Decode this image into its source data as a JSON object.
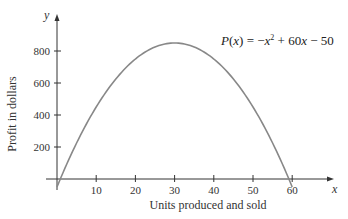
{
  "chart_data": {
    "type": "line",
    "title": "",
    "equation": "P(x) = −x² + 60x − 50",
    "xlabel": "Units produced and sold",
    "ylabel": "Profit in dollars",
    "x_axis_var": "x",
    "y_axis_var": "y",
    "xlim": [
      0,
      65
    ],
    "ylim": [
      -50,
      950
    ],
    "x_ticks": [
      10,
      20,
      30,
      40,
      50,
      60
    ],
    "y_ticks": [
      200,
      400,
      600,
      800
    ],
    "grid": false,
    "series": [
      {
        "name": "P(x)",
        "x": [
          0,
          1,
          5,
          10,
          15,
          20,
          25,
          30,
          35,
          40,
          45,
          50,
          55,
          59,
          60
        ],
        "values": [
          -50,
          9,
          225,
          450,
          625,
          750,
          825,
          850,
          825,
          750,
          625,
          450,
          225,
          9,
          -50
        ]
      }
    ],
    "curve_color": "#888888",
    "axis_color": "#333333"
  },
  "labels": {
    "xlabel": "Units produced and sold",
    "ylabel": "Profit in dollars",
    "x_var": "x",
    "y_var": "y",
    "eq_P": "P",
    "eq_x": "x",
    "eq_rest1": ") = −",
    "eq_x2": "x",
    "eq_sq": "2",
    "eq_rest2": " + 60",
    "eq_x3": "x",
    "eq_rest3": " − 50"
  }
}
